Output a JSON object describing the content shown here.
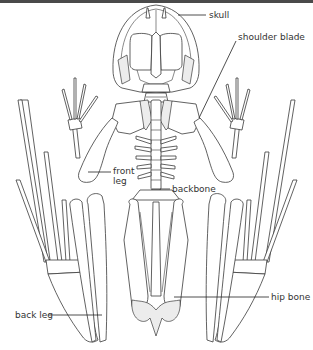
{
  "diagram": {
    "labels": {
      "skull": "skull",
      "shoulder_blade": "shoulder blade",
      "front_leg": "front leg",
      "backbone": "backbone",
      "hip_bone": "hip bone",
      "back_leg": "back leg"
    }
  },
  "colors": {
    "line": "#3a3a3a",
    "background": "#ffffff",
    "top_bar": "#4a4a4a",
    "text": "#333333"
  }
}
